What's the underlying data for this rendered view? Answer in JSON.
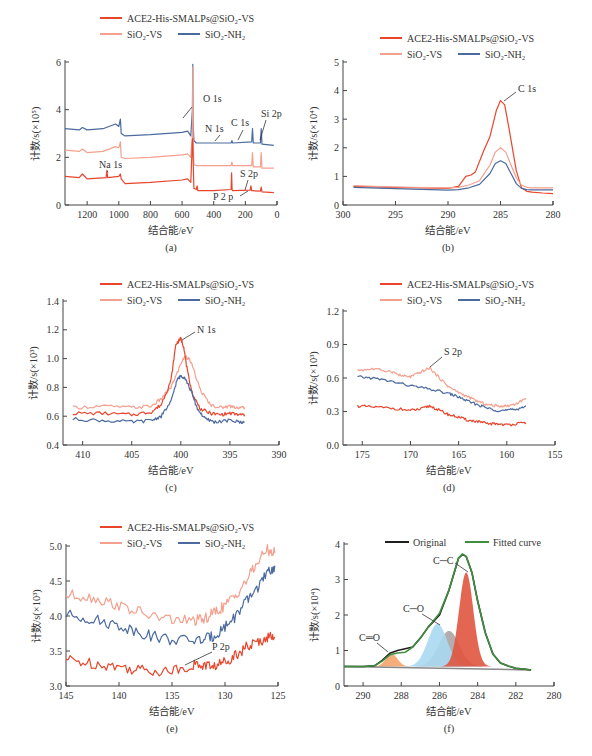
{
  "colors": {
    "ace2": "#e8452c",
    "sio2_vs": "#f4a08e",
    "sio2_nh2": "#4a6aa0",
    "original": "#1f1f1f",
    "fitted": "#3f8f3f",
    "axis": "#444444",
    "peak_cc": "#e0553f",
    "peak_co": "#a8d8ef",
    "peak_co_grey": "#a89e9e",
    "peak_c_o_double": "#f4a46a"
  },
  "legend": {
    "ace2": "ACE2-His-SMALPs@SiO₂-VS",
    "sio2_vs": "SiO₂-VS",
    "sio2_nh2": "SiO₂-NH₂"
  },
  "chart_data": [
    {
      "id": "a",
      "panel_label": "(a)",
      "type": "line",
      "title": "Survey spectrum",
      "xlabel": "结合能/eV",
      "ylabel": "计数/s(×10⁵)",
      "xlim": [
        1340,
        0
      ],
      "ylim": [
        0,
        6
      ],
      "xticks": [
        1200,
        1000,
        800,
        600,
        400,
        200,
        0
      ],
      "yticks": [
        0,
        2,
        4,
        6
      ],
      "annotations": [
        "O 1s",
        "N 1s",
        "C 1s",
        "Si 2p",
        "Na 1s",
        "S 2p",
        "P 2 p"
      ],
      "series": [
        {
          "name": "SiO₂-NH₂",
          "key": "sio2_nh2",
          "x": [
            1340,
            1250,
            1230,
            1200,
            1100,
            1020,
            1000,
            990,
            985,
            960,
            800,
            600,
            565,
            545,
            535,
            532,
            530,
            525,
            510,
            400,
            290,
            285,
            280,
            160,
            155,
            150,
            105,
            100,
            95,
            20
          ],
          "y": [
            3.2,
            3.15,
            3.25,
            3.15,
            3.2,
            3.4,
            3.3,
            3.6,
            3.0,
            2.9,
            2.95,
            3.05,
            3.1,
            2.9,
            4.0,
            5.9,
            3.5,
            2.7,
            2.6,
            2.6,
            2.6,
            2.7,
            2.6,
            2.65,
            3.2,
            2.6,
            2.6,
            3.2,
            2.55,
            2.5
          ]
        },
        {
          "name": "SiO₂-VS",
          "key": "sio2_vs",
          "x": [
            1340,
            1250,
            1230,
            1200,
            1100,
            1020,
            1000,
            990,
            985,
            960,
            800,
            600,
            565,
            545,
            535,
            532,
            530,
            525,
            510,
            400,
            290,
            285,
            280,
            160,
            155,
            150,
            105,
            100,
            95,
            20
          ],
          "y": [
            2.3,
            2.25,
            2.35,
            2.2,
            2.25,
            2.45,
            2.4,
            2.65,
            2.0,
            1.95,
            2.0,
            2.1,
            2.15,
            2.0,
            3.0,
            5.8,
            2.6,
            1.7,
            1.65,
            1.65,
            1.65,
            1.8,
            1.65,
            1.65,
            2.2,
            1.6,
            1.6,
            2.2,
            1.55,
            1.55
          ]
        },
        {
          "name": "ACE2-His-SMALPs@SiO₂-VS",
          "key": "ace2",
          "x": [
            1340,
            1250,
            1230,
            1200,
            1080,
            1075,
            1070,
            1000,
            990,
            985,
            960,
            800,
            600,
            565,
            545,
            535,
            532,
            530,
            525,
            510,
            505,
            500,
            400,
            290,
            287,
            284,
            280,
            170,
            165,
            160,
            155,
            105,
            100,
            95,
            20
          ],
          "y": [
            1.2,
            1.15,
            1.3,
            1.1,
            1.15,
            1.45,
            1.15,
            1.2,
            1.3,
            1.1,
            0.9,
            0.95,
            1.05,
            1.1,
            0.95,
            2.7,
            2.8,
            2.0,
            0.7,
            0.65,
            0.8,
            0.6,
            0.6,
            0.65,
            1.35,
            0.65,
            0.6,
            0.62,
            0.8,
            0.6,
            0.6,
            0.58,
            0.75,
            0.55,
            0.52
          ]
        }
      ]
    },
    {
      "id": "b",
      "panel_label": "(b)",
      "type": "line",
      "title": "C 1s",
      "xlabel": "结合能/eV",
      "ylabel": "计数/s(×10⁴)",
      "xlim": [
        300,
        280
      ],
      "ylim": [
        0,
        5
      ],
      "xticks": [
        300,
        295,
        290,
        285,
        280
      ],
      "yticks": [
        0,
        1,
        2,
        3,
        4,
        5
      ],
      "annotations": [
        "C 1s"
      ],
      "series": [
        {
          "name": "ACE2-His-SMALPs@SiO₂-VS",
          "key": "ace2",
          "x": [
            299,
            295,
            290,
            289,
            288.3,
            287.8,
            287.4,
            286.6,
            286,
            285.4,
            285,
            284.6,
            284.2,
            283.5,
            283,
            282.5,
            282,
            281,
            280
          ],
          "y": [
            0.65,
            0.62,
            0.58,
            0.65,
            1.0,
            1.05,
            1.15,
            1.9,
            2.4,
            3.3,
            3.65,
            3.5,
            2.7,
            1.2,
            0.6,
            0.48,
            0.45,
            0.42,
            0.4
          ]
        },
        {
          "name": "SiO₂-VS",
          "key": "sio2_vs",
          "x": [
            299,
            295,
            290,
            289,
            288,
            287,
            286,
            285.5,
            285,
            284.5,
            284,
            283.5,
            283,
            282.5,
            282,
            281,
            280
          ],
          "y": [
            0.68,
            0.63,
            0.6,
            0.62,
            0.7,
            0.85,
            1.4,
            1.85,
            2.0,
            1.85,
            1.4,
            0.95,
            0.7,
            0.62,
            0.6,
            0.6,
            0.6
          ]
        },
        {
          "name": "SiO₂-NH₂",
          "key": "sio2_nh2",
          "x": [
            299,
            295,
            290,
            289,
            288,
            287,
            286,
            285.5,
            285,
            284.5,
            284,
            283.5,
            283,
            282.5,
            282,
            281,
            280
          ],
          "y": [
            0.62,
            0.57,
            0.52,
            0.54,
            0.6,
            0.72,
            1.1,
            1.45,
            1.55,
            1.45,
            1.1,
            0.75,
            0.58,
            0.54,
            0.53,
            0.53,
            0.53
          ]
        }
      ]
    },
    {
      "id": "c",
      "panel_label": "(c)",
      "type": "line",
      "title": "N 1s",
      "xlabel": "结合能/eV",
      "ylabel": "计数/s(×10³)",
      "xlim": [
        412,
        390
      ],
      "ylim": [
        0.4,
        1.4
      ],
      "xticks": [
        410,
        405,
        400,
        395,
        390
      ],
      "yticks": [
        0.4,
        0.6,
        0.8,
        1.0,
        1.2,
        1.4
      ],
      "annotations": [
        "N 1s"
      ],
      "series": [
        {
          "name": "SiO₂-VS",
          "key": "sio2_vs",
          "x": [
            411,
            408,
            405,
            403,
            402,
            401,
            400.5,
            399.9,
            399.5,
            399,
            398,
            397,
            396,
            395,
            394,
            393.5
          ],
          "y": [
            0.66,
            0.67,
            0.66,
            0.67,
            0.72,
            0.8,
            0.88,
            0.98,
            1.02,
            0.98,
            0.78,
            0.68,
            0.66,
            0.67,
            0.66,
            0.66
          ]
        },
        {
          "name": "ACE2-His-SMALPs@SiO₂-VS",
          "key": "ace2",
          "x": [
            411,
            408,
            405,
            403,
            402,
            401,
            400.5,
            400,
            399.7,
            399.3,
            398.8,
            398,
            397,
            396,
            395,
            394,
            393.5
          ],
          "y": [
            0.62,
            0.62,
            0.61,
            0.63,
            0.68,
            0.85,
            1.1,
            1.14,
            1.08,
            0.9,
            0.75,
            0.65,
            0.62,
            0.61,
            0.62,
            0.61,
            0.61
          ]
        },
        {
          "name": "SiO₂-NH₂",
          "key": "sio2_nh2",
          "x": [
            411,
            408,
            405,
            403,
            402,
            401,
            400.4,
            400,
            399.6,
            399,
            398.3,
            397.5,
            396.5,
            395,
            394,
            393.5
          ],
          "y": [
            0.58,
            0.57,
            0.56,
            0.57,
            0.6,
            0.7,
            0.85,
            0.88,
            0.87,
            0.78,
            0.65,
            0.58,
            0.56,
            0.57,
            0.56,
            0.56
          ]
        }
      ]
    },
    {
      "id": "d",
      "panel_label": "(d)",
      "type": "line",
      "title": "S 2p",
      "xlabel": "结合能/eV",
      "ylabel": "计数/s(×10³)",
      "xlim": [
        177,
        155
      ],
      "ylim": [
        0,
        1.2
      ],
      "xticks": [
        175,
        170,
        165,
        160,
        155
      ],
      "yticks": [
        0,
        0.3,
        0.6,
        0.9,
        1.2
      ],
      "annotations": [
        "S 2p"
      ],
      "series": [
        {
          "name": "SiO₂-VS",
          "key": "sio2_vs",
          "x": [
            175.5,
            174,
            172,
            171,
            170,
            169,
            168,
            167,
            166,
            165,
            164,
            163,
            162,
            161,
            160,
            159,
            158
          ],
          "y": [
            0.67,
            0.68,
            0.66,
            0.62,
            0.61,
            0.65,
            0.69,
            0.6,
            0.52,
            0.47,
            0.43,
            0.39,
            0.36,
            0.35,
            0.35,
            0.37,
            0.42
          ]
        },
        {
          "name": "SiO₂-NH₂",
          "key": "sio2_nh2",
          "x": [
            175.5,
            174,
            172,
            170,
            168,
            166,
            165,
            164,
            163,
            162,
            161,
            160,
            159,
            158
          ],
          "y": [
            0.61,
            0.6,
            0.57,
            0.53,
            0.5,
            0.46,
            0.43,
            0.39,
            0.36,
            0.33,
            0.31,
            0.31,
            0.32,
            0.35
          ]
        },
        {
          "name": "ACE2-His-SMALPs@SiO₂-VS",
          "key": "ace2",
          "x": [
            175.5,
            174,
            172,
            170,
            169,
            168,
            167,
            166,
            165,
            164,
            163,
            162,
            161,
            160,
            159,
            158
          ],
          "y": [
            0.35,
            0.34,
            0.33,
            0.31,
            0.32,
            0.35,
            0.31,
            0.27,
            0.25,
            0.22,
            0.21,
            0.19,
            0.19,
            0.18,
            0.19,
            0.2
          ]
        }
      ]
    },
    {
      "id": "e",
      "panel_label": "(e)",
      "type": "line",
      "title": "P 2p",
      "xlabel": "结合能/eV",
      "ylabel": "计数/s(×10³)",
      "xlim": [
        145,
        125
      ],
      "ylim": [
        3.0,
        5.0
      ],
      "xticks": [
        145,
        140,
        135,
        130,
        125
      ],
      "yticks": [
        3.0,
        3.5,
        4.0,
        4.5,
        5.0
      ],
      "annotations": [
        "P 2p"
      ],
      "series": [
        {
          "name": "SiO₂-VS",
          "key": "sio2_vs",
          "x": [
            145,
            143,
            141,
            139,
            137,
            135,
            133,
            132,
            131,
            130,
            129,
            128,
            127,
            126,
            125.3
          ],
          "y": [
            4.3,
            4.28,
            4.2,
            4.1,
            4.0,
            3.95,
            3.93,
            3.95,
            4.05,
            4.15,
            4.3,
            4.5,
            4.75,
            4.95,
            4.9
          ]
        },
        {
          "name": "SiO₂-NH₂",
          "key": "sio2_nh2",
          "x": [
            145,
            143,
            141,
            139,
            137,
            135,
            133,
            132,
            131,
            130,
            129,
            128,
            127,
            126,
            125.3
          ],
          "y": [
            4.02,
            3.97,
            3.9,
            3.82,
            3.72,
            3.66,
            3.65,
            3.66,
            3.72,
            3.85,
            4.0,
            4.2,
            4.4,
            4.6,
            4.72
          ]
        },
        {
          "name": "ACE2-His-SMALPs@SiO₂-VS",
          "key": "ace2",
          "x": [
            145,
            143,
            141,
            139,
            137,
            135,
            133,
            132,
            131,
            130,
            129,
            128,
            127,
            126,
            125.3
          ],
          "y": [
            3.38,
            3.33,
            3.3,
            3.25,
            3.22,
            3.22,
            3.3,
            3.3,
            3.28,
            3.35,
            3.45,
            3.55,
            3.62,
            3.7,
            3.7
          ]
        }
      ]
    },
    {
      "id": "f",
      "panel_label": "(f)",
      "type": "area",
      "title": "C 1s peak fitting",
      "xlabel": "结合能/eV",
      "ylabel": "计数/s(×10⁴)",
      "xlim": [
        291,
        280
      ],
      "ylim": [
        0,
        4
      ],
      "xticks": [
        290,
        288,
        286,
        284,
        282,
        280
      ],
      "yticks": [
        0,
        1,
        2,
        3,
        4
      ],
      "legend": [
        "Original",
        "Fitted curve"
      ],
      "annotations": [
        "C─C",
        "C─O",
        "C═O"
      ],
      "baseline": 0.55,
      "components": [
        {
          "name": "C═O",
          "center": 288.5,
          "height": 0.35,
          "width": 0.45,
          "color_key": "peak_c_o_double"
        },
        {
          "name": "C─O (grey)",
          "center": 285.5,
          "height": 1.0,
          "width": 0.8,
          "color_key": "peak_co_grey"
        },
        {
          "name": "C─O",
          "center": 286.1,
          "height": 1.2,
          "width": 0.75,
          "color_key": "peak_co"
        },
        {
          "name": "C─C",
          "center": 284.6,
          "height": 2.65,
          "width": 0.55,
          "color_key": "peak_cc"
        }
      ],
      "series": [
        {
          "name": "Original",
          "key": "original",
          "x": [
            291,
            290,
            289.4,
            289,
            288.6,
            288.2,
            287.8,
            287.4,
            287,
            286.6,
            286,
            285.5,
            285,
            284.8,
            284.6,
            284.3,
            284,
            283.6,
            283.2,
            282.8,
            282.4,
            282,
            281.6,
            281.2
          ],
          "y": [
            0.55,
            0.55,
            0.57,
            0.72,
            0.92,
            1.0,
            1.05,
            1.1,
            1.35,
            1.65,
            2.0,
            2.7,
            3.6,
            3.7,
            3.65,
            3.2,
            2.4,
            1.5,
            0.9,
            0.65,
            0.56,
            0.5,
            0.48,
            0.45
          ]
        },
        {
          "name": "Fitted curve",
          "key": "fitted",
          "x": [
            291,
            290,
            289.4,
            289,
            288.6,
            288.2,
            287.8,
            287.4,
            287,
            286.6,
            286,
            285.5,
            285,
            284.8,
            284.6,
            284.3,
            284,
            283.6,
            283.2,
            282.8,
            282.4,
            282,
            281.6,
            281.2
          ],
          "y": [
            0.55,
            0.55,
            0.57,
            0.7,
            0.88,
            0.93,
            0.95,
            1.1,
            1.35,
            1.65,
            2.05,
            2.7,
            3.6,
            3.72,
            3.65,
            3.2,
            2.4,
            1.5,
            0.9,
            0.65,
            0.56,
            0.5,
            0.48,
            0.45
          ]
        }
      ]
    }
  ],
  "panels_layout": [
    {
      "id": "a",
      "x0": 65,
      "x1": 277,
      "y0": 205,
      "y1": 62,
      "legend_y": 18,
      "legend_x": 100
    },
    {
      "id": "b",
      "x0": 343,
      "x1": 553,
      "y0": 205,
      "y1": 62,
      "legend_y": 38,
      "legend_x": 380
    },
    {
      "id": "c",
      "x0": 63,
      "x1": 279,
      "y0": 445,
      "y1": 301,
      "legend_y": 284,
      "legend_x": 100
    },
    {
      "id": "d",
      "x0": 343,
      "x1": 555,
      "y0": 445,
      "y1": 311,
      "legend_y": 284,
      "legend_x": 380
    },
    {
      "id": "e",
      "x0": 66,
      "x1": 278,
      "y0": 686,
      "y1": 546,
      "legend_y": 527,
      "legend_x": 100
    },
    {
      "id": "f",
      "x0": 344,
      "x1": 554,
      "y0": 686,
      "y1": 544,
      "legend_y": 542,
      "legend_x": 385
    }
  ]
}
